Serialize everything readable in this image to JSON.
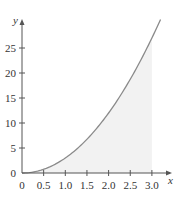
{
  "chart_data": {
    "type": "area",
    "title": "",
    "xlabel": "x",
    "ylabel": "y",
    "function": "y = 3x^2",
    "xlim": [
      0,
      3.2
    ],
    "ylim": [
      0,
      30
    ],
    "x_ticks": [
      0,
      0.5,
      1.0,
      1.5,
      2.0,
      2.5,
      3.0
    ],
    "x_tick_labels": [
      "0",
      "0.5",
      "1.0",
      "1.5",
      "2.0",
      "2.5",
      "3.0"
    ],
    "y_ticks": [
      0,
      5,
      10,
      15,
      20,
      25
    ],
    "y_tick_labels": [
      "0",
      "5",
      "10",
      "15",
      "20",
      "25"
    ],
    "grid": false,
    "shaded_region": {
      "x_from": 0,
      "x_to": 3.0,
      "description": "area under curve"
    },
    "series": [
      {
        "name": "curve",
        "x": [
          0,
          0.5,
          1.0,
          1.5,
          2.0,
          2.5,
          3.0,
          3.2
        ],
        "values": [
          0,
          0.75,
          3,
          6.75,
          12,
          18.75,
          27,
          30.7
        ]
      }
    ],
    "colors": {
      "curve": "#8a8a8a",
      "shade": "#f2f2f2",
      "axis": "#555555"
    }
  }
}
